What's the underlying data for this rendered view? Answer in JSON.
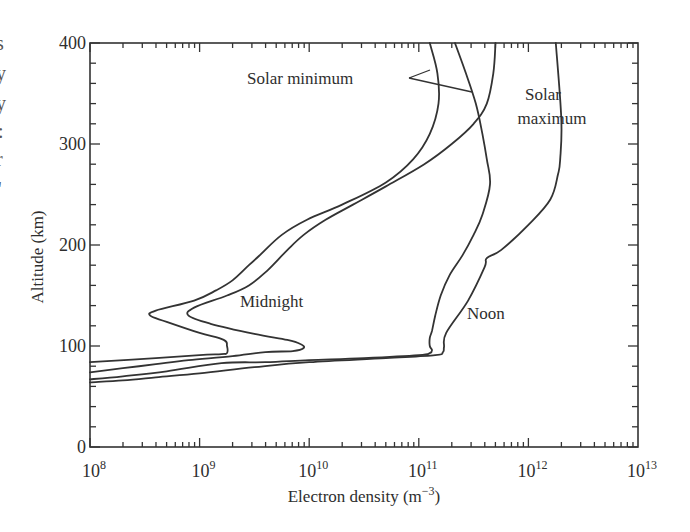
{
  "chart_data": {
    "type": "line",
    "title": "",
    "xlabel": "Electron density (m⁻³)",
    "xlabel_base": "Electron density (m",
    "xlabel_exp": "−3",
    "xlabel_close": ")",
    "ylabel": "Altitude (km)",
    "xscale": "log",
    "xlim": [
      100000000.0,
      10000000000000.0
    ],
    "ylim": [
      0,
      400
    ],
    "grid": false,
    "x_ticks": [
      {
        "base": "10",
        "exp": "8",
        "value": 100000000.0
      },
      {
        "base": "10",
        "exp": "9",
        "value": 1000000000.0
      },
      {
        "base": "10",
        "exp": "10",
        "value": 10000000000.0
      },
      {
        "base": "10",
        "exp": "11",
        "value": 100000000000.0
      },
      {
        "base": "10",
        "exp": "12",
        "value": 1000000000000.0
      },
      {
        "base": "10",
        "exp": "13",
        "value": 10000000000000.0
      }
    ],
    "y_ticks": [
      {
        "label": "0",
        "value": 0
      },
      {
        "label": "100",
        "value": 100
      },
      {
        "label": "200",
        "value": 200
      },
      {
        "label": "300",
        "value": 300
      },
      {
        "label": "400",
        "value": 400
      }
    ],
    "y_minor_step": 20,
    "annotations": {
      "solar_minimum": "Solar minimum",
      "solar_maximum_line1": "Solar",
      "solar_maximum_line2": "maximum",
      "midnight": "Midnight",
      "noon": "Noon"
    },
    "series": [
      {
        "name": "Solar minimum, midnight",
        "x_log10": [
          11.1,
          11.17,
          11.18,
          11.1,
          10.95,
          10.7,
          10.3,
          9.98,
          9.75,
          9.55,
          9.45,
          9.3,
          9.15,
          8.95,
          8.6,
          8.55,
          8.7,
          9.0,
          9.22,
          9.25,
          9.25,
          9.2,
          9.0,
          8.6,
          8.0
        ],
        "y_km": [
          400,
          370,
          340,
          310,
          285,
          262,
          240,
          225,
          210,
          190,
          180,
          165,
          155,
          145,
          135,
          130,
          124,
          113,
          106,
          100,
          93,
          92,
          91,
          88,
          84
        ]
      },
      {
        "name": "Solar minimum, noon",
        "x_log10": [
          11.33,
          11.43,
          11.52,
          11.58,
          11.62,
          11.65,
          11.58,
          11.5,
          11.4,
          11.28,
          11.2,
          11.15,
          11.12,
          11.1,
          11.1,
          11.12,
          11.1,
          11.0,
          10.5,
          10.0,
          9.6,
          9.2,
          8.7,
          8.3,
          8.0
        ],
        "y_km": [
          400,
          370,
          340,
          310,
          285,
          260,
          230,
          210,
          190,
          170,
          150,
          130,
          115,
          108,
          100,
          96,
          93,
          91,
          88,
          86,
          84,
          83,
          75,
          70,
          67
        ]
      },
      {
        "name": "Solar maximum, midnight",
        "x_log10": [
          11.7,
          11.68,
          11.62,
          11.5,
          11.3,
          11.05,
          10.7,
          10.4,
          10.15,
          9.95,
          9.8,
          9.62,
          9.45,
          9.25,
          8.95,
          8.9,
          9.1,
          9.5,
          9.8,
          9.92,
          9.95,
          9.85,
          9.6,
          9.3,
          8.9,
          8.6,
          8.3,
          8.0
        ],
        "y_km": [
          400,
          370,
          340,
          320,
          300,
          280,
          258,
          240,
          225,
          210,
          195,
          175,
          160,
          150,
          138,
          130,
          122,
          112,
          106,
          102,
          98,
          95,
          94,
          90,
          86,
          82,
          78,
          74
        ]
      },
      {
        "name": "Solar maximum, noon",
        "x_log10": [
          12.25,
          12.3,
          12.29,
          12.27,
          12.2,
          12.0,
          11.75,
          11.62,
          11.6,
          11.45,
          11.25,
          11.23,
          11.22,
          11.15,
          10.7,
          10.0,
          9.5,
          9.0,
          8.6,
          8.3,
          8.0
        ],
        "y_km": [
          400,
          325,
          285,
          270,
          245,
          220,
          195,
          187,
          178,
          145,
          113,
          99,
          94,
          91,
          88,
          84,
          79,
          73,
          69,
          66,
          64
        ]
      }
    ]
  },
  "page_fragments": {
    "left_edge_chars": [
      "s",
      "y",
      "y",
      ":",
      "r",
      "'"
    ]
  }
}
